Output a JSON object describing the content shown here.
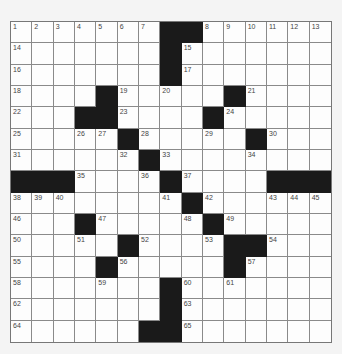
{
  "puzzle": {
    "size": 15,
    "colors": {
      "black": "#1a1a1a",
      "white": "#fdfdfd",
      "line": "#8a8a8a",
      "background": "#f4f4f4"
    },
    "rows": [
      "1234567##89ABCD",
      "E......#F......",
      "G......#H......",
      "I...#J.K..#L...",
      "M..##N...#O....",
      "P..QR#S..T.#U..",
      "V....W#X...Y...",
      "###Z..a#b...###",
      "cde....f#g..hij",
      "k..#l...m#n....",
      "o..p.#q..r##s..",
      "t...#u....#v...",
      "w...x..#y.z....",
      "A......#B......",
      "C.....##D......"
    ],
    "numbers": [
      [
        [
          0,
          1
        ],
        [
          1,
          2
        ],
        [
          2,
          3
        ],
        [
          3,
          4
        ],
        [
          4,
          5
        ],
        [
          5,
          6
        ],
        [
          6,
          7
        ],
        [
          9,
          8
        ],
        [
          10,
          9
        ],
        [
          11,
          10
        ],
        [
          12,
          11
        ],
        [
          13,
          12
        ],
        [
          14,
          13
        ]
      ],
      [
        [
          0,
          14
        ],
        [
          8,
          15
        ]
      ],
      [
        [
          0,
          16
        ],
        [
          8,
          17
        ]
      ],
      [
        [
          0,
          18
        ],
        [
          5,
          19
        ],
        [
          7,
          20
        ],
        [
          11,
          21
        ]
      ],
      [
        [
          0,
          22
        ],
        [
          5,
          23
        ],
        [
          10,
          24
        ]
      ],
      [
        [
          0,
          25
        ],
        [
          3,
          26
        ],
        [
          4,
          27
        ],
        [
          6,
          28
        ],
        [
          9,
          29
        ],
        [
          12,
          30
        ]
      ],
      [
        [
          0,
          31
        ],
        [
          5,
          32
        ],
        [
          7,
          33
        ],
        [
          11,
          34
        ]
      ],
      [
        [
          3,
          35
        ],
        [
          6,
          36
        ],
        [
          8,
          37
        ]
      ],
      [
        [
          0,
          38
        ],
        [
          1,
          39
        ],
        [
          2,
          40
        ],
        [
          7,
          41
        ],
        [
          9,
          42
        ],
        [
          12,
          43
        ],
        [
          13,
          44
        ],
        [
          14,
          45
        ]
      ],
      [
        [
          0,
          46
        ],
        [
          4,
          47
        ],
        [
          8,
          48
        ],
        [
          10,
          49
        ]
      ],
      [
        [
          0,
          50
        ],
        [
          3,
          51
        ],
        [
          6,
          52
        ],
        [
          9,
          53
        ],
        [
          12,
          54
        ]
      ],
      [
        [
          0,
          55
        ],
        [
          5,
          56
        ],
        [
          11,
          57
        ]
      ],
      [
        [
          0,
          58
        ],
        [
          4,
          59
        ],
        [
          8,
          60
        ],
        [
          10,
          61
        ]
      ],
      [
        [
          0,
          62
        ],
        [
          8,
          63
        ]
      ],
      [
        [
          0,
          64
        ],
        [
          8,
          65
        ]
      ]
    ]
  }
}
